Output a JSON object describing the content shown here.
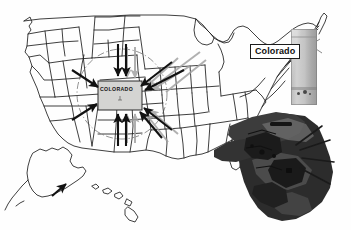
{
  "figure": {
    "type": "annotated-map-diagram",
    "region": "United States",
    "background_color": "#ffffff",
    "style": "grayscale line map with photographic insets"
  },
  "callout": {
    "label": "Colorado",
    "text_color": "#101010",
    "border_color": "#1c1c1c",
    "fill_color": "#ffffff",
    "leader_line": "points from label box down-right to grey object"
  },
  "highlighted_state": {
    "name": "COLORADO",
    "label": "COLORADO",
    "fill_color": "#d4d4d2",
    "border_color": "#2a2a2a"
  },
  "map": {
    "outline_color": "#1d1d1d",
    "state_border_color": "#2b2b2b",
    "insets": [
      "Alaska",
      "Hawaii"
    ],
    "focus_circle": {
      "style": "dash-dot",
      "color": "#4a4a4a",
      "description": "dash-dot circle centered on Colorado"
    }
  },
  "arrows": {
    "count": 12,
    "direction": "inward toward Colorado",
    "primary_color": "#111111",
    "shadow_color": "#9e9e9e",
    "items": [
      {
        "name": "arrow-from-north-left",
        "from": "north",
        "angle_deg": 270
      },
      {
        "name": "arrow-from-north-right",
        "from": "north",
        "angle_deg": 270
      },
      {
        "name": "arrow-from-south-left",
        "from": "south",
        "angle_deg": 90
      },
      {
        "name": "arrow-from-south-right",
        "from": "south",
        "angle_deg": 90
      },
      {
        "name": "arrow-from-northwest",
        "from": "northwest",
        "angle_deg": 315
      },
      {
        "name": "arrow-from-southwest",
        "from": "southwest",
        "angle_deg": 45
      },
      {
        "name": "arrow-from-northeast-a",
        "from": "northeast",
        "angle_deg": 225
      },
      {
        "name": "arrow-from-northeast-b",
        "from": "northeast",
        "angle_deg": 225
      },
      {
        "name": "arrow-from-east",
        "from": "east",
        "angle_deg": 180
      },
      {
        "name": "arrow-from-southeast",
        "from": "southeast",
        "angle_deg": 135
      },
      {
        "name": "arrow-from-far-northeast",
        "from": "northeast",
        "angle_deg": 225
      },
      {
        "name": "arrow-alaska-pointer",
        "from": "alaska",
        "angle_deg": 300
      }
    ]
  },
  "photo_objects": [
    {
      "name": "grey-rectangular-object",
      "description": "light grey upright rectangular photographic object",
      "tone": "#c2c2bd"
    },
    {
      "name": "dark-vehicle-object",
      "description": "dark photographic vehicle / equipment overlay",
      "tone": "#2a2a2a"
    }
  ]
}
